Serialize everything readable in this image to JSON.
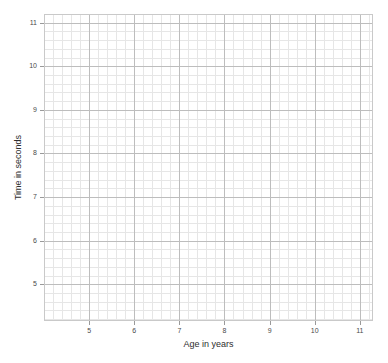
{
  "chart_data": {
    "type": "scatter",
    "title": "",
    "subtitle": "",
    "xlabel": "Age in years",
    "ylabel": "Time in seconds",
    "xlim": [
      4.0,
      11.27
    ],
    "ylim": [
      4.18,
      11.2
    ],
    "xticks": [
      5,
      6,
      7,
      8,
      9,
      10,
      11
    ],
    "yticks": [
      5,
      6,
      7,
      8,
      9,
      10,
      11
    ],
    "xtick_labels": [
      "5",
      "6",
      "7",
      "8",
      "9",
      "10",
      "11"
    ],
    "ytick_labels": [
      "5",
      "6",
      "7",
      "8",
      "9",
      "10",
      "11"
    ],
    "x": [],
    "y": [],
    "series": [],
    "annotations": [],
    "legend": null,
    "legend_position": "none",
    "grid": {
      "enabled": true,
      "major_step_x": 1,
      "major_step_y": 1,
      "minor_subdivisions": 5,
      "major_color": "#bdbdbd",
      "minor_color": "#e6e6e6"
    },
    "note": "Blank graph-paper style plot with no data points plotted."
  },
  "axes": {
    "spine_color": "#c9c9c9",
    "tick_color": "#9a9a9a",
    "label_color": "#4a4a4a",
    "title_color": "#2e2e2e",
    "background": "#ffffff"
  }
}
